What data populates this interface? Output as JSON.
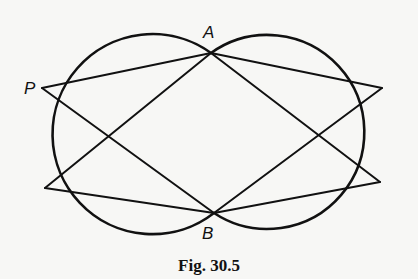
{
  "figure": {
    "caption": "Fig. 30.5",
    "labels": {
      "A": "A",
      "B": "B",
      "P": "P"
    },
    "stroke_color": "#111111",
    "background_color": "#f7f7f5"
  },
  "geometry": {
    "points": {
      "A": [
        211,
        53
      ],
      "B": [
        214,
        213
      ],
      "P": [
        42,
        88
      ],
      "L2": [
        45,
        188
      ],
      "R1": [
        382,
        88
      ],
      "R2": [
        380,
        182
      ]
    },
    "circles": [
      {
        "name": "left-circle",
        "cx": 128,
        "cy": 130,
        "r": 100
      },
      {
        "name": "right-circle",
        "cx": 300,
        "cy": 130,
        "r": 97
      }
    ],
    "segments": [
      [
        "P",
        "A"
      ],
      [
        "P",
        "B"
      ],
      [
        "L2",
        "A"
      ],
      [
        "L2",
        "B"
      ],
      [
        "R1",
        "A"
      ],
      [
        "R1",
        "B"
      ],
      [
        "R2",
        "A"
      ],
      [
        "R2",
        "B"
      ]
    ]
  }
}
